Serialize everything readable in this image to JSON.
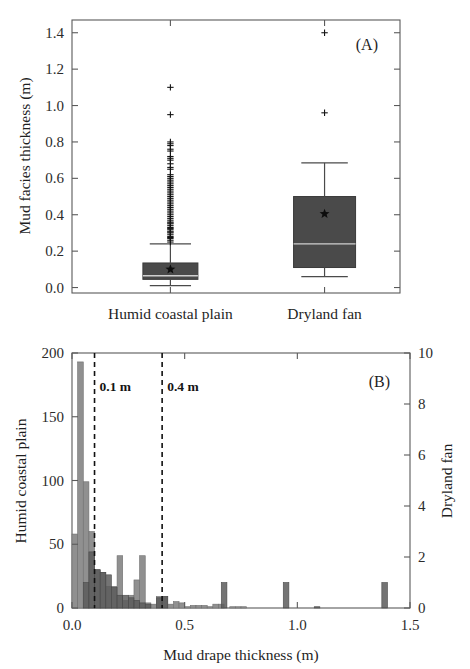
{
  "figure": {
    "background": "#ffffff",
    "box_color": "#4a4a4a",
    "hist_humid_color": "#909090",
    "hist_dryland_color": "#5c5c5c",
    "dash_color": "#111111"
  },
  "panel_a": {
    "label": "(A)",
    "ylabel": "Mud facies thickness (m)",
    "yticks": [
      "0.0",
      "0.2",
      "0.4",
      "0.6",
      "0.8",
      "1.0",
      "1.2",
      "1.4"
    ],
    "ylim": [
      -0.03,
      1.47
    ],
    "categories": [
      "Humid coastal plain",
      "Dryland fan"
    ]
  },
  "panel_b": {
    "label": "(B)",
    "xlabel": "Mud drape thickness (m)",
    "ylabel_left": "Humid coastal plain",
    "ylabel_right": "Dryland fan",
    "xticks": [
      "0.0",
      "0.5",
      "1.0",
      "1.5"
    ],
    "yticks_left": [
      "0",
      "50",
      "100",
      "150",
      "200"
    ],
    "yticks_right": [
      "0",
      "2",
      "4",
      "6",
      "8",
      "10"
    ],
    "annotations": [
      {
        "name": "threshold-0-1",
        "text": "0.1 m",
        "x": 0.1
      },
      {
        "name": "threshold-0-4",
        "text": "0.4 m",
        "x": 0.4
      }
    ]
  },
  "chart_data": [
    {
      "type": "box",
      "title": "(A) Mud facies thickness by depositional setting",
      "xlabel": "",
      "ylabel": "Mud facies thickness (m)",
      "ylim": [
        -0.03,
        1.47
      ],
      "yticks": [
        0.0,
        0.2,
        0.4,
        0.6,
        0.8,
        1.0,
        1.2,
        1.4
      ],
      "grid": false,
      "legend": "none",
      "categories": [
        "Humid coastal plain",
        "Dryland fan"
      ],
      "boxes": [
        {
          "name": "Humid coastal plain",
          "whisker_low": 0.01,
          "q1": 0.045,
          "median": 0.065,
          "q3": 0.135,
          "whisker_high": 0.24,
          "mean": 0.1,
          "outliers": [
            0.25,
            0.26,
            0.27,
            0.275,
            0.28,
            0.29,
            0.3,
            0.305,
            0.31,
            0.32,
            0.325,
            0.33,
            0.34,
            0.35,
            0.355,
            0.36,
            0.37,
            0.38,
            0.39,
            0.4,
            0.41,
            0.42,
            0.43,
            0.44,
            0.45,
            0.46,
            0.47,
            0.48,
            0.49,
            0.5,
            0.51,
            0.52,
            0.53,
            0.54,
            0.55,
            0.56,
            0.57,
            0.58,
            0.59,
            0.6,
            0.61,
            0.62,
            0.65,
            0.66,
            0.68,
            0.7,
            0.71,
            0.72,
            0.75,
            0.76,
            0.78,
            0.79,
            0.8,
            0.95,
            1.1
          ]
        },
        {
          "name": "Dryland fan",
          "whisker_low": 0.06,
          "q1": 0.11,
          "median": 0.24,
          "q3": 0.5,
          "whisker_high": 0.685,
          "mean": 0.405,
          "outliers": [
            0.96,
            1.4
          ]
        }
      ]
    },
    {
      "type": "bar",
      "title": "(B) Mud drape thickness distribution",
      "xlabel": "Mud drape thickness (m)",
      "ylabel": "Humid coastal plain",
      "ylabel_secondary": "Dryland fan",
      "xlim": [
        0.0,
        1.5
      ],
      "ylim": [
        0,
        200
      ],
      "ylim_secondary": [
        0,
        10
      ],
      "xticks": [
        0.0,
        0.5,
        1.0,
        1.5
      ],
      "yticks": [
        0,
        50,
        100,
        150,
        200
      ],
      "yticks_secondary": [
        0,
        2,
        4,
        6,
        8,
        10
      ],
      "grid": false,
      "bin_width": 0.025,
      "annotations": [
        {
          "text": "0.1 m",
          "x": 0.1,
          "style": "dashed-vline"
        },
        {
          "text": "0.4 m",
          "x": 0.4,
          "style": "dashed-vline"
        }
      ],
      "series": [
        {
          "name": "Humid coastal plain",
          "axis": "left",
          "bins": [
            0.0125,
            0.0375,
            0.0625,
            0.0875,
            0.1125,
            0.1375,
            0.1625,
            0.1875,
            0.2125,
            0.2375,
            0.2625,
            0.2875,
            0.3125,
            0.3375,
            0.3625,
            0.3875,
            0.4125,
            0.4375,
            0.4625,
            0.4875,
            0.5125,
            0.5375,
            0.5625,
            0.5875,
            0.6125,
            0.6375,
            0.6625,
            0.6875,
            0.7125,
            0.7375,
            0.7625,
            0.7875,
            0.8125,
            0.8375
          ],
          "values": [
            58,
            193,
            99,
            60,
            30,
            28,
            17,
            17,
            41,
            6,
            10,
            22,
            41,
            4,
            3,
            9,
            9,
            3,
            5,
            4,
            1,
            2,
            2,
            2,
            1,
            3,
            3,
            0,
            1,
            1,
            1,
            0,
            0,
            0
          ]
        },
        {
          "name": "Dryland fan",
          "axis": "right",
          "bins": [
            0.0625,
            0.0875,
            0.1125,
            0.1375,
            0.1625,
            0.1875,
            0.2125,
            0.2375,
            0.2625,
            0.2875,
            0.3125,
            0.3375,
            0.3875,
            0.4125,
            0.675,
            0.95,
            1.0875,
            1.3875
          ],
          "values": [
            1.0,
            2.2,
            1.5,
            1.4,
            1.3,
            0.8,
            0.5,
            0.5,
            0.4,
            0.3,
            0.2,
            0.15,
            0.4,
            0.45,
            1.0,
            1.0,
            0.05,
            1.0
          ]
        }
      ]
    }
  ]
}
